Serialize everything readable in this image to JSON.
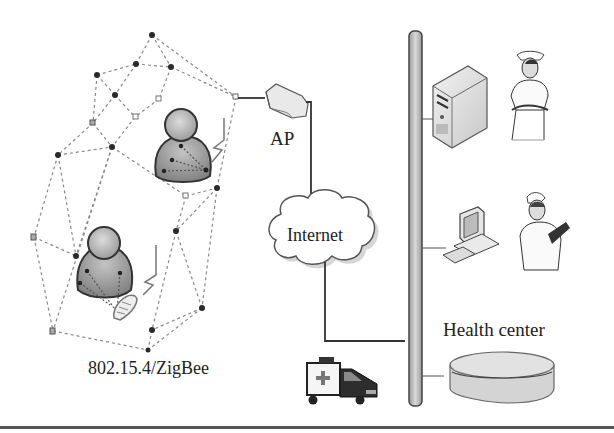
{
  "diagram": {
    "labels": {
      "ap": "AP",
      "internet": "Internet",
      "zigbee": "802.15.4/ZigBee",
      "health_center": "Health center"
    },
    "nodes": [
      {
        "id": "mesh-network",
        "label": "802.15.4/ZigBee",
        "kind": "sensor-mesh"
      },
      {
        "id": "patient-1",
        "kind": "person-with-body-sensors"
      },
      {
        "id": "patient-2",
        "kind": "person-with-body-sensors-and-phone"
      },
      {
        "id": "access-point",
        "label": "AP",
        "kind": "router"
      },
      {
        "id": "internet",
        "label": "Internet",
        "kind": "cloud"
      },
      {
        "id": "backbone",
        "kind": "bus"
      },
      {
        "id": "server",
        "kind": "server-tower"
      },
      {
        "id": "nurse-1",
        "kind": "person-nurse"
      },
      {
        "id": "workstation",
        "kind": "desktop-computer"
      },
      {
        "id": "nurse-2",
        "kind": "person-nurse-with-clipboard"
      },
      {
        "id": "database",
        "label": "Health center",
        "kind": "database-disk"
      },
      {
        "id": "ambulance",
        "kind": "vehicle"
      }
    ],
    "edges": [
      {
        "from": "mesh-network",
        "to": "access-point"
      },
      {
        "from": "access-point",
        "to": "internet"
      },
      {
        "from": "internet",
        "to": "backbone"
      },
      {
        "from": "backbone",
        "to": "server"
      },
      {
        "from": "backbone",
        "to": "workstation"
      },
      {
        "from": "backbone",
        "to": "database"
      }
    ],
    "colors": {
      "line": "#333333",
      "dashed": "#8a8a8a",
      "node_dark": "#2a2a2a",
      "person_fill": "#9a9a9a",
      "person_head": "#bdbdbd",
      "bus_fill": "#c8c8c8",
      "cloud_fill": "#ffffff",
      "db_fill": "#d4d4d4"
    }
  }
}
